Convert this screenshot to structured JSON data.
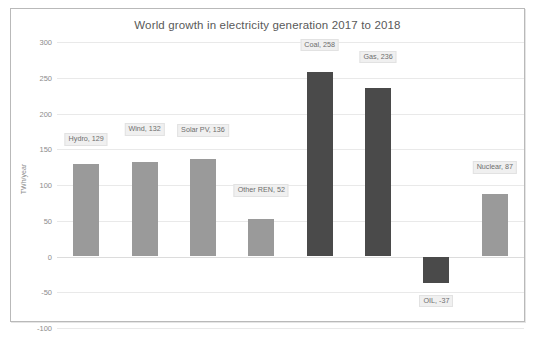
{
  "chart_data": {
    "type": "bar",
    "title": "World growth in electricity generation 2017 to 2018",
    "xlabel": "",
    "ylabel": "TWh/year",
    "ylim": [
      -100,
      300
    ],
    "ytick_labels": [
      "300",
      "250",
      "200",
      "150",
      "100",
      "50",
      "0",
      "-50",
      "-100"
    ],
    "ytick_values": [
      300,
      250,
      200,
      150,
      100,
      50,
      0,
      -50,
      -100
    ],
    "grid": true,
    "legend": "none",
    "categories": [
      "Hydro",
      "Wind",
      "Solar PV",
      "Other REN",
      "Coal",
      "Gas",
      "OIL",
      "Nuclear"
    ],
    "values": [
      129,
      132,
      136,
      52,
      258,
      236,
      -37,
      87
    ],
    "data_labels": [
      "Hydro, 129",
      "Wind, 132",
      "Solar PV, 136",
      "Other REN, 52",
      "Coal, 258",
      "Gas, 236",
      "OIL, -37",
      "Nuclear, 87"
    ],
    "bar_colors": [
      "#9a9a9a",
      "#9a9a9a",
      "#9a9a9a",
      "#9a9a9a",
      "#4a4a4a",
      "#4a4a4a",
      "#4a4a4a",
      "#9a9a9a"
    ],
    "colors": {
      "renewable": "#9a9a9a",
      "fossil": "#4a4a4a",
      "gridline": "#e9e9e9",
      "text": "#595959",
      "label_background": "#f0f0f0",
      "frame_border": "#b9b9b9"
    }
  }
}
